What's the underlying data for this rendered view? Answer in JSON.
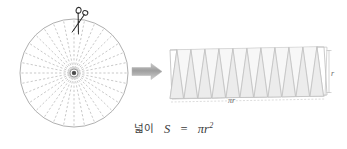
{
  "figure": {
    "title_formula": "S = πr²",
    "caption_prefix": "넓이",
    "caption_var": "S",
    "caption_eq": "=",
    "caption_expr": "πr",
    "caption_exp": "2",
    "background_color": "#ffffff",
    "line_color": "#9a9a9a",
    "dash_color": "#b0b0b0",
    "fill_color": "#ececec",
    "arrow_color": "#a8a8a8",
    "text_color": "#3a3a3a",
    "label_color": "#6a6a6a"
  },
  "circle": {
    "name": "sectored-circle",
    "center_x": 74,
    "center_y": 73,
    "radius": 54,
    "sector_count": 32,
    "hub_radius": 4,
    "stroke": "#9a9a9a",
    "spoke_style": "dashed"
  },
  "scissors": {
    "name": "scissors-icon",
    "x": 78,
    "y": 20,
    "rotation_deg": 18,
    "color": "#2b2b2b"
  },
  "arrow": {
    "name": "transform-arrow",
    "x1": 131,
    "x2": 168,
    "y": 71,
    "color": "#a8a8a8"
  },
  "sawtooth": {
    "name": "rearranged-sectors",
    "left": 168,
    "top": 47,
    "width": 155,
    "height": 52,
    "triangle_count": 11,
    "base_label": "πr",
    "height_label": "r",
    "fill": "#ececec",
    "stroke": "#b4b4b4"
  },
  "labels": {
    "base": "πr",
    "height": "r"
  }
}
